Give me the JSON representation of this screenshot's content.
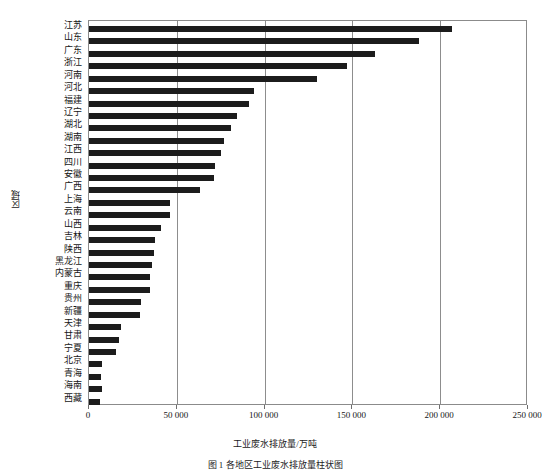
{
  "figure": {
    "caption": "图 1 各地区工业废水排放量柱状图",
    "ylabel": "区域",
    "xlabel": "工业废水排放量/万吨"
  },
  "axis": {
    "xticks": [
      "0",
      "50 000",
      "100 000",
      "150 000",
      "200 000",
      "250 000"
    ],
    "xtick_values": [
      0,
      50000,
      100000,
      150000,
      200000,
      250000
    ]
  },
  "chart_data": {
    "type": "bar",
    "orientation": "horizontal",
    "title": "图 1 各地区工业废水排放量柱状图",
    "xlabel": "工业废水排放量/万吨",
    "ylabel": "区域",
    "xlim": [
      0,
      250000
    ],
    "grid": true,
    "legend": "none",
    "bar_color": "#1c1c1c",
    "categories": [
      "江苏",
      "山东",
      "广东",
      "浙江",
      "河南",
      "河北",
      "福建",
      "辽宁",
      "湖北",
      "湖南",
      "江西",
      "四川",
      "安徽",
      "广西",
      "上海",
      "云南",
      "山西",
      "吉林",
      "陕西",
      "黑龙江",
      "内蒙古",
      "重庆",
      "贵州",
      "新疆",
      "天津",
      "甘肃",
      "宁夏",
      "北京",
      "青海",
      "海南",
      "西藏"
    ],
    "values": [
      207000,
      188000,
      163000,
      147000,
      130000,
      94000,
      91000,
      84000,
      81000,
      77000,
      75000,
      71500,
      71000,
      63000,
      46200,
      46000,
      41000,
      37800,
      37200,
      36000,
      34800,
      34500,
      29500,
      29000,
      18000,
      17000,
      15200,
      7500,
      7000,
      7500,
      6000
    ]
  }
}
